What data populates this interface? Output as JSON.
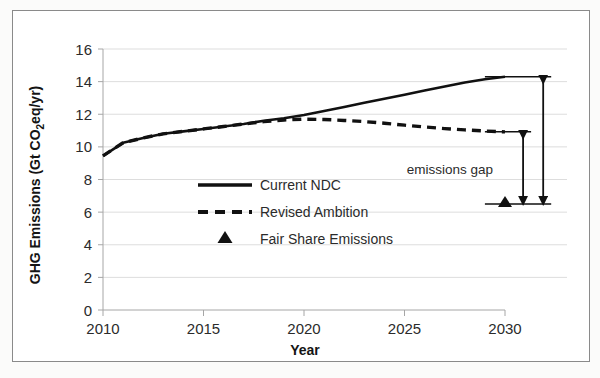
{
  "figure": {
    "background_color": "#ffffff",
    "border_color": "#8a8a8a",
    "series_color": "#111111",
    "gridline_color": "#d9d9d9",
    "axis_color": "#a6a6a6"
  },
  "chart_data": {
    "type": "line",
    "title": "",
    "xlabel": "Year",
    "ylabel_parts": {
      "before": "GHG Emissions (Gt CO",
      "sub": "2",
      "after": "eq/yr)"
    },
    "ylabel": "GHG Emissions (Gt CO2eq/yr)",
    "xlim": [
      2010,
      2030
    ],
    "ylim": [
      0,
      16
    ],
    "xticks": [
      2010,
      2015,
      2020,
      2025,
      2030
    ],
    "xtick_labels": [
      "2010",
      "2015",
      "2020",
      "2025",
      "2030"
    ],
    "yticks": [
      0,
      2,
      4,
      6,
      8,
      10,
      12,
      14,
      16
    ],
    "ytick_labels": [
      "0",
      "2",
      "4",
      "6",
      "8",
      "10",
      "12",
      "14",
      "16"
    ],
    "grid": true,
    "grid_axis": "y",
    "legend_position": "center-left-inside",
    "x": [
      2010,
      2011,
      2012,
      2013,
      2014,
      2015,
      2016,
      2017,
      2018,
      2019,
      2020,
      2021,
      2022,
      2023,
      2024,
      2025,
      2026,
      2027,
      2028,
      2029,
      2030
    ],
    "series": [
      {
        "name": "Current NDC",
        "style": "solid",
        "values": [
          9.45,
          10.25,
          10.55,
          10.8,
          10.95,
          11.1,
          11.25,
          11.4,
          11.6,
          11.75,
          11.95,
          12.2,
          12.45,
          12.7,
          12.95,
          13.2,
          13.45,
          13.7,
          13.95,
          14.15,
          14.3
        ]
      },
      {
        "name": "Revised Ambition",
        "style": "dashed",
        "values": [
          9.45,
          10.25,
          10.55,
          10.8,
          10.95,
          11.1,
          11.25,
          11.4,
          11.55,
          11.65,
          11.7,
          11.68,
          11.62,
          11.55,
          11.45,
          11.33,
          11.22,
          11.12,
          11.04,
          10.97,
          10.92
        ]
      }
    ],
    "points": [
      {
        "name": "Fair Share Emissions",
        "style": "triangle-marker",
        "x": 2030,
        "y": 6.5
      }
    ],
    "annotations": [
      {
        "name": "emissions-gap",
        "text": "emissions gap",
        "arrows": [
          {
            "name": "inner-gap-arrow",
            "x": 2030.9,
            "y_from": 6.5,
            "y_to": 10.92
          },
          {
            "name": "outer-gap-arrow",
            "x": 2031.9,
            "y_from": 6.5,
            "y_to": 14.3
          }
        ]
      }
    ]
  },
  "legend": {
    "items": [
      {
        "label": "Current NDC",
        "marker": "solid-line"
      },
      {
        "label": "Revised Ambition",
        "marker": "dashed-line"
      },
      {
        "label": "Fair Share Emissions",
        "marker": "triangle"
      }
    ]
  }
}
